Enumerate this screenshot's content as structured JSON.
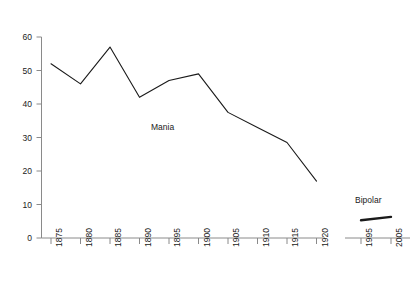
{
  "chart_data": {
    "type": "line",
    "title": "",
    "subtitle": "",
    "xlabel": "",
    "ylabel": "",
    "ylim": [
      0,
      60
    ],
    "y_ticks": [
      0,
      10,
      20,
      30,
      40,
      50,
      60
    ],
    "grid": false,
    "legend_position": "inline-annotation",
    "axis_break": true,
    "panels": [
      {
        "name": "mania-panel",
        "x_ticks": [
          1875,
          1880,
          1885,
          1890,
          1895,
          1900,
          1905,
          1910,
          1915,
          1920
        ],
        "xlim": [
          1875,
          1920
        ]
      },
      {
        "name": "bipolar-panel",
        "x_ticks": [
          1995,
          2005
        ],
        "xlim": [
          1995,
          2005
        ]
      }
    ],
    "series": [
      {
        "name": "Mania",
        "panel": "mania-panel",
        "x": [
          1875,
          1880,
          1885,
          1890,
          1895,
          1900,
          1905,
          1910,
          1915,
          1920
        ],
        "values": [
          52,
          46,
          57,
          42,
          47,
          49,
          37.5,
          33,
          28.5,
          17
        ],
        "color": "#1a1a1a",
        "line_width": 1.1,
        "label": "Mania"
      },
      {
        "name": "Bipolar",
        "panel": "bipolar-panel",
        "x": [
          1995,
          2005
        ],
        "values": [
          5.3,
          6.3
        ],
        "color": "#1a1a1a",
        "line_width": 2.4,
        "label": "Bipolar"
      }
    ]
  },
  "axes": {
    "y_tick_labels": [
      "60",
      "50",
      "40",
      "30",
      "20",
      "10",
      "0"
    ],
    "x_tick_labels_main": [
      "1875",
      "1880",
      "1885",
      "1890",
      "1895",
      "1900",
      "1905",
      "1910",
      "1915",
      "1920"
    ],
    "x_tick_labels_inset": [
      "1995",
      "2005"
    ],
    "axis_color": "#8a8a8a"
  },
  "annotations": {
    "mania_label": "Mania",
    "bipolar_label": "Bipolar"
  }
}
